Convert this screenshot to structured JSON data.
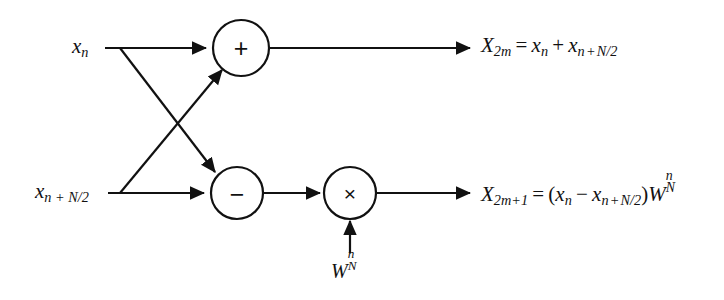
{
  "figure": {
    "colors": {
      "line": "#111111",
      "text": "#111111",
      "background": "#ffffff"
    }
  },
  "inputs": [
    {
      "id": "x-n",
      "label_main": "x",
      "label_sub": "n",
      "x": 100,
      "y": 48
    },
    {
      "id": "x-n-plus-N-2",
      "label_main": "x",
      "label_sub": "n + N/2",
      "x": 105,
      "y": 193
    }
  ],
  "operators": [
    {
      "id": "adder",
      "symbol": "+",
      "name": "plus",
      "cx": 241,
      "cy": 48,
      "r": 28
    },
    {
      "id": "subtractor",
      "symbol": "−",
      "name": "minus",
      "cx": 237,
      "cy": 193,
      "r": 26
    },
    {
      "id": "multiplier",
      "symbol": "×",
      "name": "times",
      "cx": 350,
      "cy": 193,
      "r": 26
    }
  ],
  "twiddle": {
    "id": "twiddle-factor",
    "base": "W",
    "sub": "N",
    "sup": "n",
    "x": 350,
    "y": 270
  },
  "outputs": [
    {
      "id": "X-2m",
      "lhs_base": "X",
      "lhs_sub": "2m",
      "eq": "=",
      "rhs": "x_n + x_{n+N/2}",
      "x": 480,
      "y": 48
    },
    {
      "id": "X-2m-plus-1",
      "lhs_base": "X",
      "lhs_sub": "2m+1",
      "eq": "=",
      "rhs": "(x_n − x_{n+N/2})W_N^n",
      "x": 480,
      "y": 193
    }
  ],
  "edges": [
    {
      "id": "top-input-to-adder",
      "from": "x-n",
      "to": "adder",
      "type": "straight"
    },
    {
      "id": "bottom-input-to-subtractor",
      "from": "x-n-plus-N-2",
      "to": "subtractor",
      "type": "straight"
    },
    {
      "id": "top-branch-to-subtractor",
      "from": "top-line-branch",
      "to": "subtractor",
      "type": "diagonal"
    },
    {
      "id": "bottom-branch-to-adder",
      "from": "bottom-line-branch",
      "to": "adder",
      "type": "diagonal"
    },
    {
      "id": "adder-to-output",
      "from": "adder",
      "to": "X-2m",
      "type": "straight"
    },
    {
      "id": "subtractor-to-multiplier",
      "from": "subtractor",
      "to": "multiplier",
      "type": "straight"
    },
    {
      "id": "twiddle-to-multiplier",
      "from": "twiddle-factor",
      "to": "multiplier",
      "type": "vertical"
    },
    {
      "id": "multiplier-to-output",
      "from": "multiplier",
      "to": "X-2m-plus-1",
      "type": "straight"
    }
  ]
}
